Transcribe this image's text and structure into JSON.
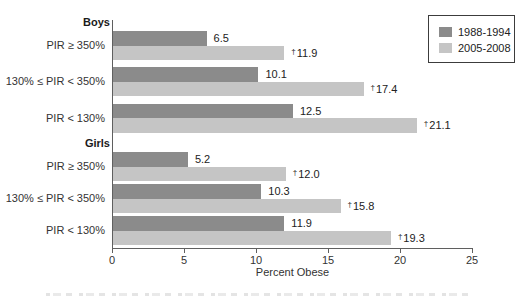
{
  "legend": {
    "entries": [
      {
        "label": "1988-1994",
        "color": "#8b8b8b"
      },
      {
        "label": "2005-2008",
        "color": "#c5c5c5"
      }
    ]
  },
  "chart_data": {
    "type": "bar",
    "orientation": "horizontal",
    "title": "",
    "xlabel": "Percent Obese",
    "xlim": [
      0,
      25
    ],
    "xticks": [
      0,
      5,
      10,
      15,
      20,
      25
    ],
    "grid": false,
    "legend_position": "top-right",
    "series_names": [
      "1988-1994",
      "2005-2008"
    ],
    "series_colors": [
      "#8b8b8b",
      "#c5c5c5"
    ],
    "footnote_marker": "†",
    "sections": [
      {
        "label": "Boys",
        "rows": [
          {
            "category": "PIR ≥ 350%",
            "values": [
              6.5,
              11.9
            ],
            "value_labels": [
              "6.5",
              "†11.9"
            ],
            "value_labels_display": [
              "6.5",
              "†11.9"
            ],
            "series_labels": [
              "6.5",
              "†"
            ]
          },
          {
            "category": "130% ≤ PIR < 350%",
            "values": [
              10.1,
              17.4
            ],
            "value_labels": [
              "10.1",
              "†17.4"
            ]
          },
          {
            "category": "PIR < 130%",
            "values": [
              12.5,
              21.1
            ],
            "value_labels": [
              "12.5",
              "†21.1"
            ]
          }
        ]
      },
      {
        "label": "Girls",
        "rows": [
          {
            "category": "PIR ≥ 350%",
            "values": [
              5.2,
              12.0
            ],
            "value_labels": [
              "5.2",
              "†12.0"
            ]
          },
          {
            "category": "130% ≤ PIR < 350%",
            "values": [
              10.3,
              15.8
            ],
            "value_labels": [
              "10.3",
              "†15.8"
            ]
          },
          {
            "category": "PIR < 130%",
            "values": [
              11.9,
              19.3
            ],
            "value_labels": [
              "11.9",
              "†19.3"
            ]
          }
        ]
      }
    ]
  }
}
